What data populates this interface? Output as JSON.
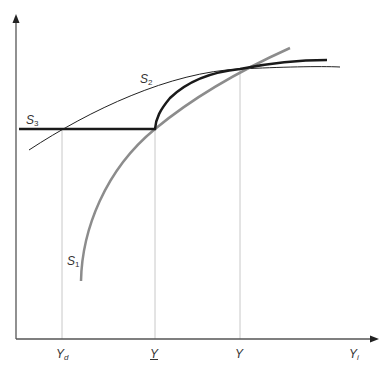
{
  "diagram": {
    "type": "economic-curves",
    "axes": {
      "x_label": {
        "main": "Y",
        "sub": "i"
      },
      "y_label": ""
    },
    "x_ticks": [
      {
        "main": "Y",
        "sub": "d",
        "underline": false
      },
      {
        "main": "Y",
        "sub": "",
        "underline": true
      },
      {
        "main": "Y",
        "sub": "",
        "underline": false
      }
    ],
    "curves": [
      {
        "name": "S",
        "sub": "1",
        "style": "thick gray",
        "color": "#8c8c8c"
      },
      {
        "name": "S",
        "sub": "2",
        "style": "thin black",
        "color": "#222222"
      },
      {
        "name": "S",
        "sub": "3",
        "style": "thick black (kinked: flat then follows S1 upward)",
        "color": "#1a1a1a"
      }
    ],
    "guides": "dotted vertical drop-lines at Y_d, Y-underline and Y"
  }
}
